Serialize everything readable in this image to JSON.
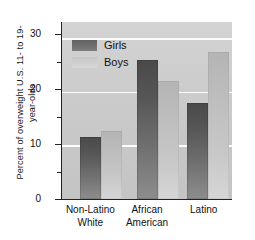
{
  "chart_data": {
    "type": "bar",
    "title": "",
    "subtitle": "",
    "xlabel": "",
    "ylabel": "Percent of overweight U.S. 11- to 19-year-olds",
    "ylabel_line1": "Percent of overweight U.S. 11- to 19-",
    "ylabel_line2": "year-olds",
    "categories": [
      "Non-Latino White",
      "African American",
      "Latino"
    ],
    "category_lines": [
      {
        "line1": "Non-Latino",
        "line2": "White"
      },
      {
        "line1": "African",
        "line2": "American"
      },
      {
        "line1": "Latino",
        "line2": ""
      }
    ],
    "series": [
      {
        "name": "Girls",
        "values": [
          11.5,
          26.0,
          18.0
        ],
        "color": "#6e6e6e"
      },
      {
        "name": "Boys",
        "values": [
          12.6,
          22.0,
          27.5
        ],
        "color": "#cccccc"
      }
    ],
    "ylim": [
      0,
      33
    ],
    "yticks": [
      0,
      10,
      20,
      30
    ],
    "ytick_labels": [
      "0",
      "10",
      "20",
      "30"
    ],
    "yminor_ticks": [
      5,
      15,
      25
    ],
    "grid": "horizontal-white",
    "gridlines_at": [
      10,
      20,
      30
    ],
    "legend_position": "upper-left-inside",
    "plot_background": "#cfcfcf",
    "page_background": "#ffffff"
  },
  "legend": {
    "items": [
      {
        "label": "Girls",
        "swatch": "girls-swatch"
      },
      {
        "label": "Boys",
        "swatch": "boys-swatch"
      }
    ]
  }
}
